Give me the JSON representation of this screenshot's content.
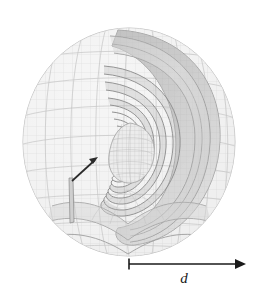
{
  "figure": {
    "background_color": "#ffffff",
    "canvas": {
      "width": 263,
      "height": 293
    }
  },
  "object": {
    "name": "nested-shell-sphere",
    "description": "Cutaway sphere revealing nested concentric teardrop shells with a fine-mesh inner core",
    "center": {
      "x": 129,
      "y": 142
    },
    "outer_radius_x": 106,
    "outer_radius_y": 114,
    "shell_count": 14,
    "colors": {
      "surface_fill": "#f2f2f2",
      "mesh_line": "#c9c9c9",
      "interior_shade": "#b4b4b4",
      "interior_shade_dark": "#9a9a9a",
      "shell_edge": "#808080",
      "core_fill": "#e6e6e6",
      "core_mesh": "#b0b0b0",
      "annotation_arrow": "#1a1a1a"
    },
    "mesh": {
      "latitude_lines": 9,
      "longitude_lines": 9
    }
  },
  "annotations": {
    "inner_arrow": {
      "label": "inner-radius-arrow",
      "start": {
        "x": 72,
        "y": 181
      },
      "end": {
        "x": 98,
        "y": 157
      },
      "color": "#2a2a2a"
    },
    "dimension": {
      "label": "d",
      "label_x": 184,
      "label_y": 279,
      "line_y": 264,
      "line_start_x": 129,
      "line_end_x": 245,
      "tick_height": 11,
      "color": "#1a1a1a"
    }
  }
}
